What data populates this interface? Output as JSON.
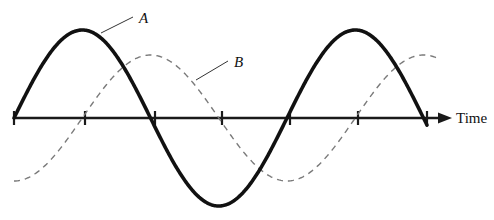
{
  "figure": {
    "background_color": "#ffffff",
    "width": 494,
    "height": 220
  },
  "axis": {
    "name": "time-axis",
    "label": "Time",
    "label_x": 456,
    "label_y": 123,
    "color": "#1a1a1a",
    "stroke_width": 2.4,
    "baseline_y": 118,
    "x_start": 14,
    "x_end": 438,
    "arrow_tip_x": 452,
    "arrow_half_height": 5.5,
    "arrow_length": 14,
    "tick_half_height": 7,
    "tick_stroke_width": 2.2,
    "tick_positions": [
      14,
      85,
      155,
      222,
      290,
      358,
      427
    ]
  },
  "labels": [
    {
      "name": "curve-a-label",
      "text": "A",
      "x": 139,
      "y": 23,
      "leader": {
        "x1": 101,
        "y1": 33,
        "x2": 133,
        "y2": 17
      }
    },
    {
      "name": "curve-b-label",
      "text": "B",
      "x": 234,
      "y": 67,
      "leader": {
        "x1": 196,
        "y1": 80,
        "x2": 228,
        "y2": 61
      }
    }
  ],
  "chart_data": {
    "type": "line",
    "title": "",
    "xlabel": "Time",
    "ylabel": "",
    "grid": false,
    "legend": "inline-annotations",
    "axis_baseline_y": 118,
    "tick_x_positions": [
      14,
      85,
      155,
      222,
      290,
      358,
      427
    ],
    "x_range_px": [
      14,
      452
    ],
    "series": [
      {
        "name": "A",
        "style": "solid",
        "color": "#111111",
        "stroke_width": 3.6,
        "amplitude_px": 88,
        "period_px": 273,
        "phase": "sine, starts at zero rising",
        "x_start": 14,
        "x_end": 427,
        "key_points": [
          {
            "x": 14,
            "y": 118,
            "kind": "zero-rising"
          },
          {
            "x": 85,
            "y": 30,
            "kind": "peak"
          },
          {
            "x": 155,
            "y": 118,
            "kind": "zero-falling"
          },
          {
            "x": 222,
            "y": 205,
            "kind": "trough"
          },
          {
            "x": 290,
            "y": 118,
            "kind": "zero-rising"
          },
          {
            "x": 358,
            "y": 30,
            "kind": "peak"
          },
          {
            "x": 427,
            "y": 118,
            "kind": "zero-falling"
          }
        ]
      },
      {
        "name": "B",
        "style": "dashed",
        "dash_pattern": "6,5",
        "color": "#7a7a7a",
        "stroke_width": 1.4,
        "amplitude_px": 63,
        "period_px": 273,
        "phase": "sine lagging A by a quarter period",
        "x_start": 14,
        "x_end": 436,
        "key_points": [
          {
            "x": 14,
            "y": 181,
            "kind": "trough"
          },
          {
            "x": 85,
            "y": 118,
            "kind": "zero-rising"
          },
          {
            "x": 155,
            "y": 55,
            "kind": "peak"
          },
          {
            "x": 222,
            "y": 118,
            "kind": "zero-falling"
          },
          {
            "x": 290,
            "y": 181,
            "kind": "trough"
          },
          {
            "x": 358,
            "y": 118,
            "kind": "zero-rising"
          },
          {
            "x": 430,
            "y": 55,
            "kind": "peak"
          }
        ]
      }
    ]
  }
}
